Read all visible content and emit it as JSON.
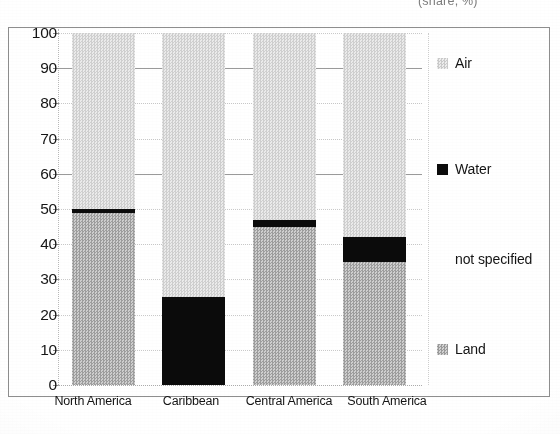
{
  "caption": {
    "top_right_clipped": "(share, %)"
  },
  "chart_data": {
    "type": "bar",
    "subtype": "stacked-100-percent",
    "title": "",
    "subtitle": "",
    "xlabel": "",
    "ylabel": "",
    "unit": "(share, %)",
    "ylim": [
      0,
      100
    ],
    "yticks": [
      0,
      10,
      20,
      30,
      40,
      50,
      60,
      70,
      80,
      90,
      100
    ],
    "ytick_labels": [
      "0",
      "10",
      "20",
      "30",
      "40",
      "50",
      "60",
      "70",
      "80",
      "90",
      "100"
    ],
    "grid": true,
    "grid_style": "dotted-horizontal",
    "legend_position": "right",
    "categories": [
      "North America",
      "Caribbean",
      "Central America",
      "South America"
    ],
    "series": [
      {
        "name": "Land",
        "key": "land",
        "color": "#b6b6b6",
        "pattern": "checker-dither-medium",
        "values": [
          49,
          0,
          45,
          35
        ]
      },
      {
        "name": "Water",
        "key": "water",
        "color": "#0b0b0b",
        "pattern": "solid-black",
        "values": [
          1,
          25,
          2,
          7
        ]
      },
      {
        "name": "not specified",
        "key": "notspec",
        "color": "#ffffff",
        "pattern": "none",
        "values": [
          0,
          0,
          0,
          0
        ]
      },
      {
        "name": "Air",
        "key": "air",
        "color": "#dcdcdc",
        "pattern": "checker-dither-light",
        "values": [
          50,
          75,
          53,
          58
        ]
      }
    ],
    "stack_boundaries": {
      "North America": {
        "land_top": 49,
        "water_top": 50,
        "air_top": 100
      },
      "Caribbean": {
        "land_top": 0,
        "water_top": 25,
        "air_top": 100
      },
      "Central America": {
        "land_top": 45,
        "water_top": 47,
        "air_top": 100
      },
      "South America": {
        "land_top": 35,
        "water_top": 42,
        "air_top": 100
      }
    }
  },
  "legend": {
    "items": [
      {
        "label": "Air",
        "swatch": "air"
      },
      {
        "label": "Water",
        "swatch": "water"
      },
      {
        "label": "not specified",
        "swatch": "notspec"
      },
      {
        "label": "Land",
        "swatch": "land"
      }
    ]
  }
}
